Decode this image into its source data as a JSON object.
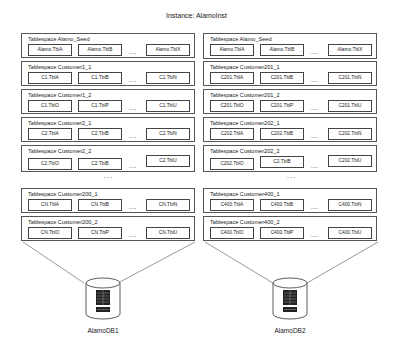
{
  "title": "Instance: AlamoInst",
  "columns": [
    {
      "tablespaces": [
        {
          "label": "Tablespace  Alamo_Seed",
          "tables": [
            "Alamo.TblA",
            "Alamo.TblB",
            "Alamo.TblX"
          ]
        },
        {
          "label": "Tablespace  Customer1_1",
          "tables": [
            "C1.TblA",
            "C1.TblB",
            "C1.TblN"
          ]
        },
        {
          "label": "Tablespace  Customer1_2",
          "tables": [
            "C1.TblO",
            "C1.TblP",
            "C1.TblU"
          ]
        },
        {
          "label": "Tablespace  Customer2_1",
          "tables": [
            "C2.TblA",
            "C2.TblB",
            "C2.TblN"
          ]
        },
        {
          "label": "Tablespace  Customer2_2",
          "tables": [
            "C2.TblO",
            "C2.TblB",
            "C2.TblU"
          ]
        },
        {
          "label": "Tablespace  Customer200_1",
          "tables": [
            "CN.TblA",
            "CN.TblB",
            "CN.TblN"
          ]
        },
        {
          "label": "Tablespace  Customer200_2",
          "tables": [
            "CN.TblO",
            "CN.TblP",
            "CN.TblU"
          ]
        }
      ],
      "database": "AlamoDB1"
    },
    {
      "tablespaces": [
        {
          "label": "Tablespace  Alamo_Seed",
          "tables": [
            "Alamo.TblA",
            "Alamo.TblB",
            "Alamo.TblX"
          ]
        },
        {
          "label": "Tablespace  Customer201_1",
          "tables": [
            "C201.TblA",
            "C201.TblB",
            "C201.TblN"
          ]
        },
        {
          "label": "Tablespace  Customer201_2",
          "tables": [
            "C201.TblO",
            "C201.TblP",
            "C201.TblU"
          ]
        },
        {
          "label": "Tablespace  Customer202_1",
          "tables": [
            "C202.TblA",
            "C202.TblB",
            "C202.TblN"
          ]
        },
        {
          "label": "Tablespace  Customer202_2",
          "tables": [
            "C202.TblO",
            "C2.TblB",
            "C202.TblU"
          ]
        },
        {
          "label": "Tablespace  Customer400_1",
          "tables": [
            "C400.TblA",
            "C400.TblB",
            "C400.TblN"
          ]
        },
        {
          "label": "Tablespace  Customer400_2",
          "tables": [
            "C400.TblO",
            "C400.TblP",
            "C400.TblU"
          ]
        }
      ],
      "database": "AlamoDB2"
    }
  ],
  "ellipsis": "...",
  "vertical_ellipsis": "..."
}
